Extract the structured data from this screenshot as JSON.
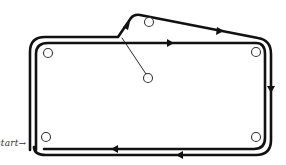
{
  "diagram": {
    "type": "track-route",
    "label_start": "start→",
    "colors": {
      "track": "#111111",
      "peg": "#333333",
      "background": "#ffffff"
    },
    "pegs": [
      {
        "id": "top-left",
        "cx": 48,
        "cy": 53
      },
      {
        "id": "branch-top",
        "cx": 149,
        "cy": 22
      },
      {
        "id": "top-right",
        "cx": 256,
        "cy": 52
      },
      {
        "id": "center",
        "cx": 148,
        "cy": 78
      },
      {
        "id": "bottom-left",
        "cx": 46,
        "cy": 137
      },
      {
        "id": "bottom-right",
        "cx": 256,
        "cy": 137
      }
    ],
    "arrows": [
      {
        "id": "branch-up",
        "direction": "up-right"
      },
      {
        "id": "top-inner",
        "direction": "right"
      },
      {
        "id": "branch-top",
        "direction": "right"
      },
      {
        "id": "right-side",
        "direction": "down"
      },
      {
        "id": "bottom-outer",
        "direction": "left"
      },
      {
        "id": "bottom-inner",
        "direction": "left"
      }
    ]
  }
}
